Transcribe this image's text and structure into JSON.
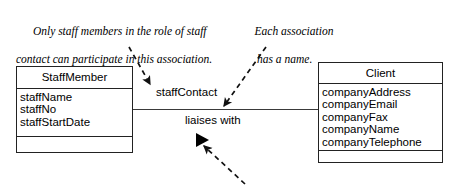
{
  "diagram": {
    "annotations": [
      {
        "id": "staff-role-note",
        "line1": "Only staff members in the role of staff",
        "line2": "contact can participate in this association."
      },
      {
        "id": "association-name-note",
        "line1": "Each association",
        "line2": "has a name."
      }
    ],
    "classes": [
      {
        "id": "staffmember",
        "name": "StaffMember",
        "attributes": [
          "staffName",
          "staffNo",
          "staffStartDate"
        ],
        "operations": []
      },
      {
        "id": "client",
        "name": "Client",
        "attributes": [
          "companyAddress",
          "companyEmail",
          "companyFax",
          "companyName",
          "companyTelephone"
        ],
        "operations": []
      }
    ],
    "association": {
      "role_label": "staffContact",
      "name_label": "liaises with",
      "direction_marker": "solid-right-triangle"
    },
    "colors": {
      "line": "#3a3a3a",
      "box_border": "#222222",
      "text": "#000000",
      "background": "#ffffff",
      "marker": "#000000"
    }
  }
}
